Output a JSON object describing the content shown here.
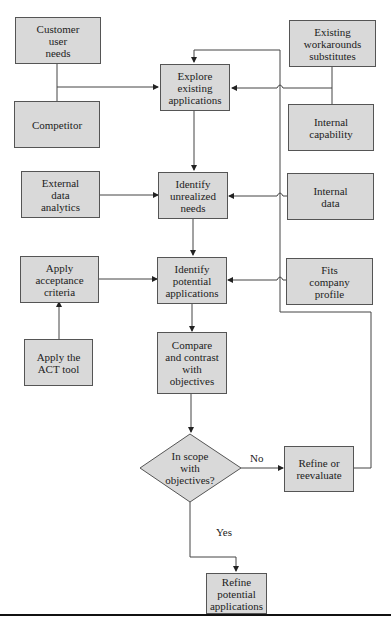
{
  "diagram": {
    "type": "flowchart",
    "nodes": {
      "customer_user_needs": "Customer\nuser\nneeds",
      "competitor": "Competitor",
      "explore_existing": "Explore\nexisting\napplications",
      "existing_workarounds": "Existing\nworkarounds\nsubstitutes",
      "internal_capability": "Internal\ncapability",
      "external_data": "External\ndata\nanalytics",
      "identify_unrealized": "Identify\nunrealized\nneeds",
      "internal_data": "Internal\ndata",
      "apply_acceptance": "Apply\nacceptance\ncriteria",
      "identify_potential": "Identify\npotential\napplications",
      "fits_company": "Fits\ncompany\nprofile",
      "apply_act": "Apply the\nACT tool",
      "compare_contrast": "Compare\nand contrast\nwith\nobjectives",
      "in_scope": "In scope\nwith\nobjectives?",
      "refine_reevaluate": "Refine or\nreevaluate",
      "refine_potential": "Refine\npotential\napplications"
    },
    "edge_labels": {
      "no": "No",
      "yes": "Yes"
    },
    "colors": {
      "box_fill": "#d9d9d9",
      "line": "#444444"
    }
  }
}
